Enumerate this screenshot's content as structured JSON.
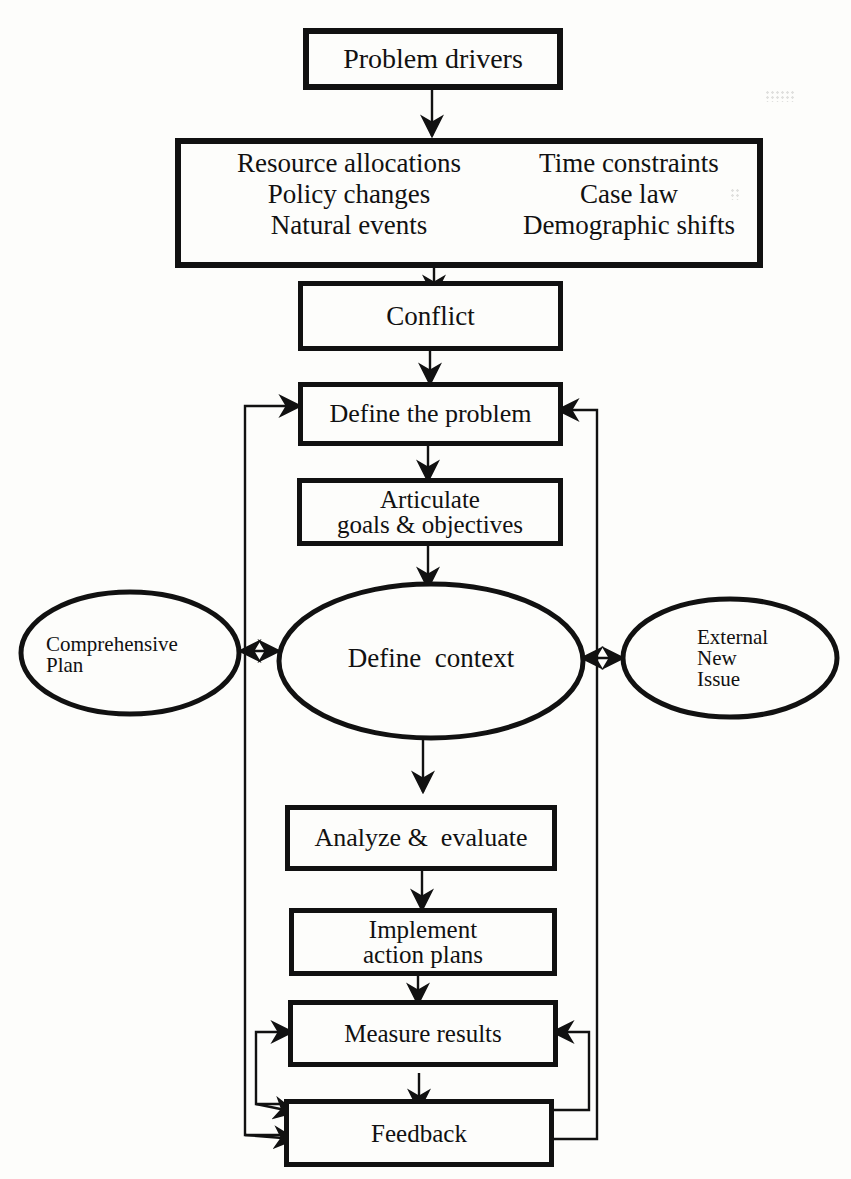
{
  "diagram": {
    "nodes": {
      "problem_drivers": {
        "label": "Problem drivers"
      },
      "drivers_list": {
        "items": [
          "Resource allocations",
          "Time constraints",
          "Policy changes",
          "Case law",
          "Natural events",
          "Demographic shifts"
        ]
      },
      "conflict": {
        "label": "Conflict"
      },
      "define_problem": {
        "label": "Define the problem"
      },
      "articulate_goals": {
        "line1": "Articulate",
        "line2": "goals & objectives"
      },
      "define_context": {
        "label": "Define  context"
      },
      "comprehensive_plan": {
        "line1": "Comprehensive",
        "line2": "Plan"
      },
      "external_new_issue": {
        "line1": "External",
        "line2": "New",
        "line3": "Issue"
      },
      "analyze_evaluate": {
        "label": "Analyze &  evaluate"
      },
      "implement_plans": {
        "line1": "Implement",
        "line2": "action plans"
      },
      "measure_results": {
        "label": "Measure results"
      },
      "feedback": {
        "label": "Feedback"
      }
    },
    "edges": [
      {
        "from": "Problem drivers",
        "to": "Drivers list"
      },
      {
        "from": "Drivers list",
        "to": "Conflict"
      },
      {
        "from": "Conflict",
        "to": "Define the problem"
      },
      {
        "from": "Define the problem",
        "to": "Articulate goals & objectives"
      },
      {
        "from": "Articulate goals & objectives",
        "to": "Define context"
      },
      {
        "from": "Define context",
        "to": "Comprehensive Plan",
        "bidirectional": true
      },
      {
        "from": "Define context",
        "to": "External New Issue",
        "bidirectional": true
      },
      {
        "from": "Define context",
        "to": "Analyze & evaluate"
      },
      {
        "from": "Analyze & evaluate",
        "to": "Implement action plans"
      },
      {
        "from": "Implement action plans",
        "to": "Measure results"
      },
      {
        "from": "Measure results",
        "to": "Feedback"
      },
      {
        "from": "Feedback",
        "to": "Measure results",
        "loop": "inner-left/right"
      },
      {
        "from": "Feedback",
        "to": "Define the problem",
        "loop": "outer-left/right"
      }
    ],
    "colors": {
      "ink": "#111111",
      "paper": "#fdfdfb"
    }
  }
}
